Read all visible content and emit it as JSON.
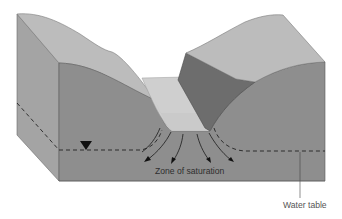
{
  "diagram": {
    "labels": {
      "zone_of_saturation": "Zone of saturation",
      "water_table": "Water table"
    },
    "symbols": {
      "water_table_marker": "inverted-triangle"
    },
    "colors": {
      "top_surface": "#b9b9b9",
      "front_face": "#8f8f8f",
      "side_face": "#a3a3a3",
      "dark_bank": "#6e6e6e",
      "water_surface": "#d2d2d2",
      "channel_bed": "#c4c4c4",
      "lines": "#222222"
    },
    "flow_arrows": 5
  }
}
